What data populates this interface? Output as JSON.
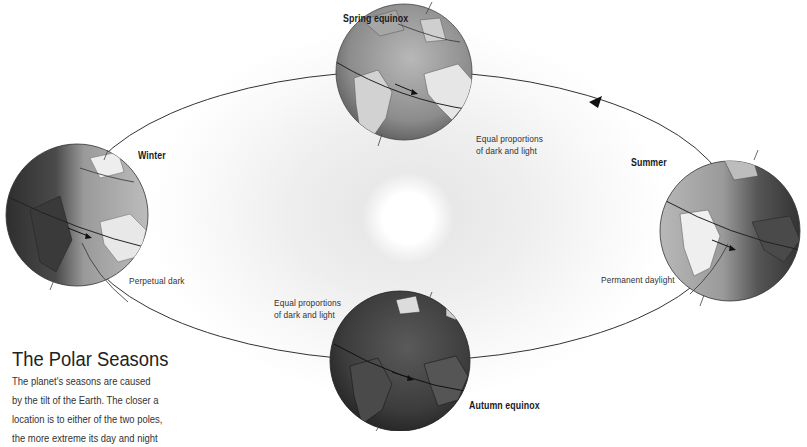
{
  "figure": {
    "title": "The Polar Seasons",
    "description_lines": [
      "The planet's seasons are caused",
      "by the tilt of the Earth. The closer a",
      "location is to either of the two poles,",
      "the more extreme its day and night"
    ]
  },
  "sun": {
    "label": ""
  },
  "positions": [
    {
      "id": "spring",
      "name": "Spring equinox",
      "note": "Equal proportions of dark and light",
      "note_lines": [
        "Equal proportions",
        "of dark and light"
      ]
    },
    {
      "id": "summer",
      "name": "Summer",
      "note": "Permanent daylight",
      "note_lines": [
        "Permanent daylight"
      ]
    },
    {
      "id": "autumn",
      "name": "Autumn equinox",
      "note": "Equal proportions of dark and light",
      "note_lines": [
        "Equal proportions",
        "of dark and light"
      ]
    },
    {
      "id": "winter",
      "name": "Winter",
      "note": "Perpetual dark",
      "note_lines": [
        "Perpetual dark"
      ]
    }
  ],
  "orbit": {
    "direction": "counter-clockwise",
    "arrow_icon": "triangle-arrow"
  },
  "colors": {
    "orbit_line": "#333333",
    "globe_dark": "#3a3a3a",
    "globe_mid": "#8a8a8a",
    "globe_light": "#d8d8d8",
    "text": "#333333"
  }
}
